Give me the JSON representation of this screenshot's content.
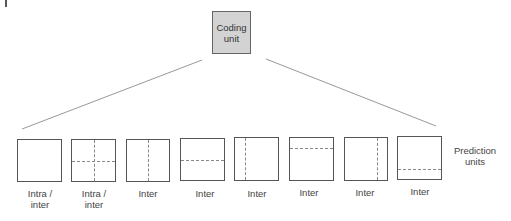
{
  "diagram": {
    "root": {
      "line1": "Coding",
      "line2": "unit"
    },
    "side_label": {
      "line1": "Prediction",
      "line2": "units"
    },
    "connector_color": "#999999",
    "coding_unit_fill": "#d3d3d3",
    "partitions": [
      {
        "id": "2Nx2N",
        "label1": "Intra /",
        "label2": "inter",
        "split": "none"
      },
      {
        "id": "NxN",
        "label1": "Intra /",
        "label2": "inter",
        "split": "quad"
      },
      {
        "id": "Nx2N",
        "label1": "Inter",
        "label2": "",
        "split": "vertical-half"
      },
      {
        "id": "2NxN",
        "label1": "Inter",
        "label2": "",
        "split": "horizontal-half"
      },
      {
        "id": "nLx2N",
        "label1": "Inter",
        "label2": "",
        "split": "vertical-quarter-left"
      },
      {
        "id": "2NxnU",
        "label1": "Inter",
        "label2": "",
        "split": "horizontal-quarter-top"
      },
      {
        "id": "nRx2N",
        "label1": "Inter",
        "label2": "",
        "split": "vertical-quarter-right"
      },
      {
        "id": "2NxnD",
        "label1": "Inter",
        "label2": "",
        "split": "horizontal-quarter-bottom"
      }
    ]
  }
}
